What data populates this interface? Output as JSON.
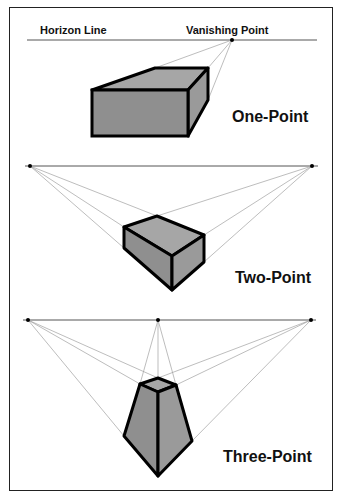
{
  "header": {
    "horizon_label": "Horizon Line",
    "vp_label": "Vanishing Point"
  },
  "panels": [
    {
      "title": "One-Point",
      "vanishing_points": 1
    },
    {
      "title": "Two-Point",
      "vanishing_points": 2
    },
    {
      "title": "Three-Point",
      "vanishing_points": 3
    }
  ],
  "colors": {
    "box_fill": "#8f8f8f",
    "box_top": "#a6a6a6",
    "box_side": "#9a9a9a",
    "outline": "#000000",
    "guide": "#9a9a9a",
    "horizon": "#444444"
  }
}
